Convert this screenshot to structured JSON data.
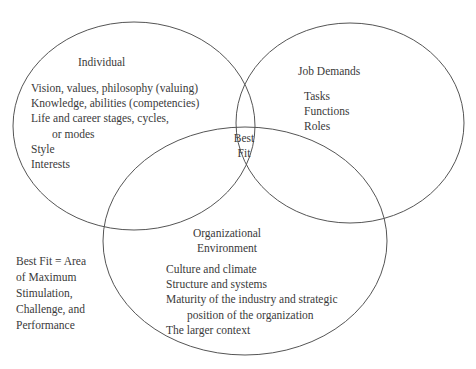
{
  "diagram": {
    "type": "venn",
    "circles": [
      {
        "id": "individual",
        "title": "Individual",
        "items": [
          "Vision, values, philosophy (valuing)",
          "Knowledge, abilities (competencies)",
          "Life and career stages, cycles,",
          "or modes",
          "Style",
          "Interests"
        ]
      },
      {
        "id": "job-demands",
        "title": "Job Demands",
        "items": [
          "Tasks",
          "Functions",
          "Roles"
        ]
      },
      {
        "id": "organizational-environment",
        "title_line1": "Organizational",
        "title_line2": "Environment",
        "items": [
          "Culture and climate",
          "Structure and systems",
          "Maturity of the industry and strategic",
          "position of the organization",
          "The larger context"
        ]
      }
    ],
    "intersection": {
      "line1": "Best",
      "line2": "Fit"
    },
    "legend": {
      "lines": [
        "Best Fit = Area",
        "of Maximum",
        "Stimulation,",
        "Challenge, and",
        "Performance"
      ]
    },
    "stroke_color": "#555555"
  }
}
